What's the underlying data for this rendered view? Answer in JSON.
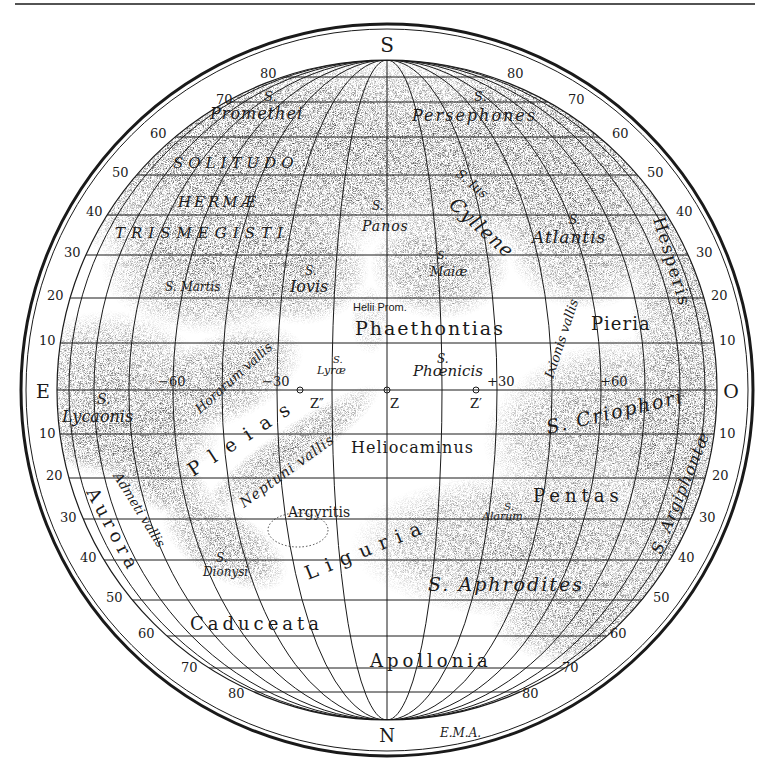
{
  "figure": {
    "type": "planetary-map",
    "top_rule": true,
    "colors": {
      "ink": "#1a1a1a",
      "paper": "#ffffff",
      "shade": "#8a8a8a"
    }
  },
  "compass": {
    "top": "S",
    "bottom": "N",
    "left": "E",
    "right": "O"
  },
  "signature": "E.M.A.",
  "latitude_scale": {
    "south_left": [
      "80",
      "70",
      "60",
      "50",
      "40",
      "30",
      "20",
      "10"
    ],
    "south_right": [
      "80",
      "70",
      "60",
      "50",
      "40",
      "30",
      "20",
      "10"
    ],
    "north_left": [
      "10",
      "20",
      "30",
      "40",
      "50",
      "60",
      "70",
      "80"
    ],
    "north_right": [
      "10",
      "20",
      "30",
      "40",
      "50",
      "60",
      "70",
      "80"
    ]
  },
  "longitude_marks": {
    "m60": "−60",
    "m30": "−30",
    "p30": "+30",
    "p60": "+60"
  },
  "center_points": {
    "z": "Z",
    "z1": "Z′",
    "z2": "Z″"
  },
  "regions": {
    "promethei_s": "S.",
    "promethei": "Promethei",
    "persephones_s": "S.",
    "persephones": "Persephones",
    "solitudo": "SOLITUDO",
    "hermae": "HERMÆ",
    "trismegisti": "TRISMEGISTI",
    "martis": "S. Martis",
    "iovis_s": "S.",
    "iovis": "Iovis",
    "panos_s": "S.",
    "panos": "Panos",
    "ius": "S. Ius",
    "cyllene": "Cyllene",
    "maiae_s": "S.",
    "maiae": "Maiæ",
    "atlantis_s": "S.",
    "atlantis": "Atlantis",
    "hesperis": "Hesperis",
    "helii_prom": "Helii Prom.",
    "phaethontias": "Phaethontias",
    "ixionis": "Ixionis vallis",
    "pieria": "Pieria",
    "horarum": "Horarum vallis",
    "lyrae_s": "S.",
    "lyrae": "Lyræ",
    "phoenicis_s": "S.",
    "phoenicis": "Phœnicis",
    "lycaonis_s": "S.",
    "lycaonis": "Lycaonis",
    "griophori": "S. Criophori",
    "pleias": "Pleias",
    "neptuni": "Neptuni vallis",
    "heliocaminus": "Heliocaminus",
    "admeti": "Admeti vallis",
    "aurora": "Aurora",
    "argyritis": "Argyritis",
    "alarum_s": "S.",
    "alarum": "Alarum",
    "pentas": "Pentas",
    "argiphontae": "S. Argiphontæ",
    "dionysi_s": "S.",
    "dionysi": "Dionysi",
    "liguria": "Liguria",
    "aphrodites": "S. Aphrodites",
    "caduceata": "Caduceata",
    "apollonia": "Apollonia"
  }
}
